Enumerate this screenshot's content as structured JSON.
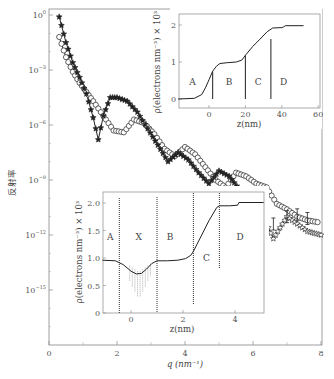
{
  "chart_data": [
    {
      "id": "main",
      "type": "scatter",
      "title": "",
      "xlabel": "q (nm⁻¹)",
      "ylabel": "反射率",
      "xlim": [
        0,
        8
      ],
      "ylim_log10": [
        -18,
        0
      ],
      "yscale": "log",
      "x_ticks": [
        "0",
        "2",
        "4",
        "6",
        "8"
      ],
      "y_ticks": [
        "10⁰",
        "10⁻³",
        "10⁻⁶",
        "10⁻⁹",
        "10⁻¹²",
        "10⁻¹⁵"
      ],
      "grid": false,
      "series": [
        {
          "name": "stars (filled/open)",
          "marker": "star",
          "x": [
            0.3,
            0.5,
            0.7,
            0.9,
            1.1,
            1.3,
            1.45,
            1.6,
            1.8,
            2.0,
            2.3,
            2.6,
            2.9,
            3.2,
            3.5,
            3.8,
            4.1,
            4.4,
            4.7,
            5.0,
            5.3,
            5.6,
            6.0,
            6.3,
            6.6,
            7.0,
            7.3,
            7.6,
            8.0
          ],
          "log10y": [
            -0.1,
            -1.5,
            -2.6,
            -3.4,
            -4.3,
            -5.6,
            -6.8,
            -5.5,
            -4.5,
            -4.5,
            -4.7,
            -5.3,
            -6.2,
            -7.1,
            -8.0,
            -7.5,
            -7.9,
            -8.6,
            -9.2,
            -8.5,
            -8.8,
            -9.5,
            -10.5,
            -11.0,
            -12.2,
            -11.0,
            -11.4,
            -11.8,
            -12.0
          ]
        },
        {
          "name": "circles (open)",
          "marker": "circle",
          "x": [
            0.3,
            0.5,
            0.7,
            0.9,
            1.1,
            1.3,
            1.6,
            1.9,
            2.2,
            2.5,
            2.8,
            3.1,
            3.4,
            3.7,
            4.0,
            4.3,
            4.6,
            4.9,
            5.2,
            5.5,
            5.8,
            6.1,
            6.4,
            6.7,
            7.0,
            7.3,
            7.6,
            7.9
          ],
          "log10y": [
            -1.2,
            -2.3,
            -3.1,
            -3.7,
            -4.2,
            -4.7,
            -5.5,
            -6.3,
            -6.4,
            -5.7,
            -5.9,
            -6.5,
            -7.3,
            -7.7,
            -7.2,
            -7.6,
            -8.3,
            -9.0,
            -9.4,
            -8.6,
            -8.8,
            -9.2,
            -9.4,
            -10.3,
            -10.6,
            -11.0,
            -11.2,
            -11.3
          ]
        },
        {
          "name": "fit curves",
          "marker": "line"
        }
      ]
    },
    {
      "id": "inset-top",
      "type": "line",
      "xlabel": "z (nm)",
      "ylabel": "ρ (electrons nm⁻³) × 10³",
      "xlim": [
        -17,
        60
      ],
      "ylim": [
        -0.2,
        2.2
      ],
      "x_ticks": [
        "0",
        "20",
        "40",
        "60"
      ],
      "y_ticks": [
        "0",
        "1",
        "2"
      ],
      "regions": [
        "A",
        "B",
        "C",
        "D"
      ],
      "boundaries_z": [
        2,
        20,
        34
      ],
      "x": [
        -17,
        -8,
        -4,
        -2,
        0,
        2,
        4,
        6,
        10,
        15,
        18,
        20,
        24,
        28,
        32,
        35,
        40,
        41,
        42,
        52
      ],
      "values": [
        0,
        0.02,
        0.12,
        0.3,
        0.52,
        0.75,
        0.88,
        0.96,
        0.98,
        1.0,
        1.05,
        1.18,
        1.42,
        1.62,
        1.82,
        1.92,
        1.93,
        1.95,
        1.98,
        1.98
      ]
    },
    {
      "id": "inset-bottom",
      "type": "line",
      "xlabel": "z (nm)",
      "ylabel": "ρ (electrons nm⁻³) × 10³",
      "xlim": [
        -1.1,
        5.1
      ],
      "ylim": [
        0,
        2.2
      ],
      "x_ticks": [
        "0",
        "2",
        "4"
      ],
      "y_ticks": [
        "0",
        "0.5",
        "1.0",
        "1.5",
        "2.0"
      ],
      "regions": [
        "A",
        "X",
        "B",
        "C",
        "D"
      ],
      "boundaries_z": [
        -0.45,
        1.0,
        2.4,
        3.4
      ],
      "x": [
        -1.1,
        -0.6,
        -0.3,
        0.0,
        0.2,
        0.4,
        0.6,
        0.8,
        1.0,
        1.4,
        1.8,
        2.1,
        2.3,
        2.4,
        2.7,
        3.0,
        3.3,
        3.4,
        3.8,
        4.1,
        4.15,
        5.1
      ],
      "values": [
        0.96,
        0.95,
        0.88,
        0.76,
        0.71,
        0.72,
        0.8,
        0.9,
        0.95,
        0.95,
        0.96,
        0.99,
        1.05,
        1.12,
        1.4,
        1.68,
        1.92,
        1.95,
        1.95,
        1.96,
        2.01,
        2.01
      ]
    }
  ],
  "labels": {
    "main_ylabel": "反射率",
    "main_xlabel": "q (nm⁻¹)",
    "inset_ylabel": "ρ(electrons nm⁻³) × 10³",
    "inset_xlabel": "z(nm)",
    "main_x_ticks": [
      "0",
      "2",
      "4",
      "6",
      "8"
    ],
    "main_y_ticks": [
      {
        "base": "10",
        "exp": "0"
      },
      {
        "base": "10",
        "exp": "−3"
      },
      {
        "base": "10",
        "exp": "−6"
      },
      {
        "base": "10",
        "exp": "−9"
      },
      {
        "base": "10",
        "exp": "−12"
      },
      {
        "base": "10",
        "exp": "−15"
      }
    ],
    "top_inset": {
      "x_ticks": [
        "0",
        "20",
        "40",
        "60"
      ],
      "y_ticks": [
        "0",
        "1",
        "2"
      ],
      "regions": [
        "A",
        "B",
        "C",
        "D"
      ]
    },
    "bottom_inset": {
      "x_ticks": [
        "0",
        "2",
        "4"
      ],
      "y_ticks": [
        "0",
        "0.5",
        "1.0",
        "1.5",
        "2.0"
      ],
      "regions": [
        "A",
        "X",
        "B",
        "C",
        "D"
      ]
    }
  },
  "colors": {
    "ink": "#222222",
    "axis": "#666666",
    "text": "#555555",
    "background": "#ffffff"
  }
}
